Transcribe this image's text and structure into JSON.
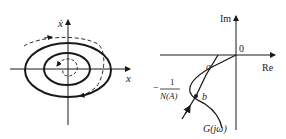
{
  "left_figure": {
    "x_axis_label": "x",
    "y_axis_label": "ẋ",
    "description": "Phase plane with two closed solid limit cycles and dashed trajectories spiraling toward outer cycle"
  },
  "right_figure": {
    "im_axis_label": "Im",
    "re_axis_label": "Re",
    "origin_label": "0",
    "point_a_label": "a",
    "point_b_label": "b",
    "neg_inv_describing_label_num": "1",
    "neg_inv_describing_label_den": "N(A)",
    "neg_sign": "−",
    "g_curve_label": "G(jω)"
  },
  "colors": {
    "stroke": "#1a1a1a",
    "background": "#ffffff"
  }
}
